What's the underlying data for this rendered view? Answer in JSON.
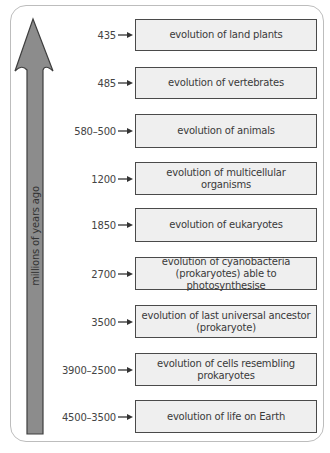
{
  "axis": {
    "label": "millions of years ago",
    "direction": "up",
    "arrow_color": "#8c8c8c"
  },
  "events": [
    {
      "time": "435",
      "label": "evolution of land plants"
    },
    {
      "time": "485",
      "label": "evolution of vertebrates"
    },
    {
      "time": "580–500",
      "label": "evolution of animals"
    },
    {
      "time": "1200",
      "label": "evolution of multicellular organisms"
    },
    {
      "time": "1850",
      "label": "evolution of eukaryotes"
    },
    {
      "time": "2700",
      "label": "evolution of cyanobacteria (prokaryotes) able to photosynthesise"
    },
    {
      "time": "3500",
      "label": "evolution of last universal ancestor (prokaryote)"
    },
    {
      "time": "3900–2500",
      "label": "evolution of cells resembling prokaryotes"
    },
    {
      "time": "4500–3500",
      "label": "evolution of life on Earth"
    }
  ],
  "colors": {
    "box_fill": "#efefef",
    "box_border": "#4a4a4a",
    "panel_border": "#bdbdbd"
  }
}
